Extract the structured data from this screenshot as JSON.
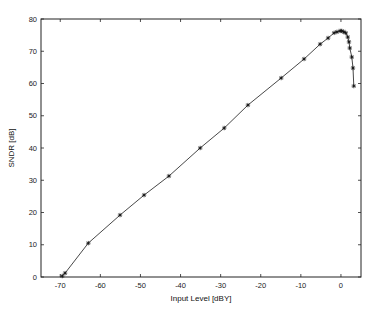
{
  "chart_data": {
    "type": "line",
    "title": "",
    "xlabel": "Input Level [dBY]",
    "ylabel": "SNDR [dB]",
    "xlim": [
      -74.8,
      5
    ],
    "ylim": [
      0,
      80
    ],
    "xticks": [
      -70,
      -60,
      -50,
      -40,
      -30,
      -20,
      -10,
      0
    ],
    "yticks": [
      0,
      10,
      20,
      30,
      40,
      50,
      60,
      70,
      80
    ],
    "grid": false,
    "legend": null,
    "marker": "*",
    "line_color": "#333333",
    "series": [
      {
        "name": "SNDR",
        "x": [
          -69.5,
          -68.8,
          -63.0,
          -55.1,
          -49.1,
          -42.9,
          -35.1,
          -29.1,
          -23.2,
          -14.9,
          -9.2,
          -5.2,
          -3.2,
          -1.7,
          -1.0,
          -0.2,
          0.2,
          0.7,
          1.2,
          1.7,
          2.0,
          2.2,
          2.7,
          3.0,
          3.2
        ],
        "y": [
          0.3,
          1.2,
          10.5,
          19.2,
          25.4,
          31.3,
          40.0,
          46.2,
          53.3,
          61.7,
          67.6,
          72.2,
          74.1,
          75.7,
          76.0,
          76.3,
          76.3,
          76.0,
          75.7,
          74.4,
          72.9,
          71.0,
          68.2,
          64.8,
          59.2
        ]
      }
    ]
  }
}
